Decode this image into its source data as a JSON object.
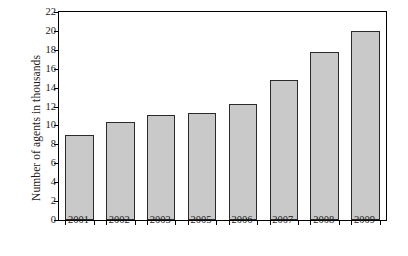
{
  "chart_data": {
    "type": "bar",
    "title": "",
    "xlabel": "",
    "ylabel": "Number of agents in thousands",
    "categories": [
      "2001",
      "2002",
      "2003",
      "2005",
      "2006",
      "2007",
      "2008",
      "2009"
    ],
    "values": [
      9.0,
      10.4,
      11.1,
      11.3,
      12.3,
      14.8,
      17.8,
      20.0
    ],
    "ylim": [
      0,
      22
    ],
    "ytick_values": [
      0,
      2,
      4,
      6,
      8,
      10,
      12,
      14,
      16,
      18,
      20,
      22
    ],
    "ytick_labels": [
      "0",
      "2",
      "4",
      "6",
      "8",
      "10",
      "12",
      "14",
      "16",
      "18",
      "20",
      "22"
    ],
    "grid": false,
    "legend": null,
    "legend_position": "none",
    "bar_fill_color": "#c9c9c9",
    "bar_edge_color": "#2a2a2a",
    "axis_color": "#000000",
    "background_color": "#ffffff"
  }
}
